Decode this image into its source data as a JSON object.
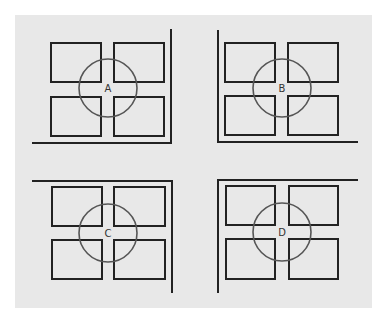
{
  "diagram": {
    "background_color": "#ffffff",
    "panel_color": "#e8e8e8",
    "rect_stroke": "#222222",
    "circle_stroke": "#555555",
    "panel": {
      "x": 15,
      "y": 15,
      "w": 357,
      "h": 293
    },
    "quadrants": [
      {
        "id": "A",
        "label": "A",
        "corner": "bottom-right",
        "circle": {
          "cx": 108,
          "cy": 88,
          "r": 29
        },
        "rects": [
          {
            "x": 51,
            "y": 43,
            "w": 50,
            "h": 39
          },
          {
            "x": 114,
            "y": 43,
            "w": 50,
            "h": 39
          },
          {
            "x": 51,
            "y": 97,
            "w": 50,
            "h": 39
          },
          {
            "x": 114,
            "y": 97,
            "w": 50,
            "h": 39
          }
        ],
        "walls": [
          {
            "x1": 171,
            "y1": 29,
            "x2": 171,
            "y2": 143
          },
          {
            "x1": 32,
            "y1": 143,
            "x2": 172,
            "y2": 143
          }
        ]
      },
      {
        "id": "B",
        "label": "B",
        "corner": "bottom-left",
        "circle": {
          "cx": 282,
          "cy": 88,
          "r": 29
        },
        "rects": [
          {
            "x": 225,
            "y": 43,
            "w": 50,
            "h": 39
          },
          {
            "x": 288,
            "y": 43,
            "w": 50,
            "h": 39
          },
          {
            "x": 225,
            "y": 96,
            "w": 50,
            "h": 39
          },
          {
            "x": 288,
            "y": 96,
            "w": 50,
            "h": 39
          }
        ],
        "walls": [
          {
            "x1": 218,
            "y1": 30,
            "x2": 218,
            "y2": 142
          },
          {
            "x1": 217,
            "y1": 142,
            "x2": 358,
            "y2": 142
          }
        ]
      },
      {
        "id": "C",
        "label": "C",
        "corner": "top-right",
        "circle": {
          "cx": 108,
          "cy": 233,
          "r": 29
        },
        "rects": [
          {
            "x": 52,
            "y": 187,
            "w": 50,
            "h": 39
          },
          {
            "x": 114,
            "y": 187,
            "w": 51,
            "h": 39
          },
          {
            "x": 52,
            "y": 240,
            "w": 50,
            "h": 39
          },
          {
            "x": 114,
            "y": 240,
            "w": 51,
            "h": 39
          }
        ],
        "walls": [
          {
            "x1": 32,
            "y1": 181,
            "x2": 173,
            "y2": 181
          },
          {
            "x1": 172,
            "y1": 180,
            "x2": 172,
            "y2": 293
          }
        ]
      },
      {
        "id": "D",
        "label": "D",
        "corner": "top-left",
        "circle": {
          "cx": 282,
          "cy": 232,
          "r": 29
        },
        "rects": [
          {
            "x": 226,
            "y": 186,
            "w": 49,
            "h": 39
          },
          {
            "x": 289,
            "y": 186,
            "w": 49,
            "h": 39
          },
          {
            "x": 226,
            "y": 239,
            "w": 49,
            "h": 40
          },
          {
            "x": 289,
            "y": 239,
            "w": 49,
            "h": 40
          }
        ],
        "walls": [
          {
            "x1": 217,
            "y1": 180,
            "x2": 358,
            "y2": 180
          },
          {
            "x1": 218,
            "y1": 179,
            "x2": 218,
            "y2": 293
          }
        ]
      }
    ]
  }
}
